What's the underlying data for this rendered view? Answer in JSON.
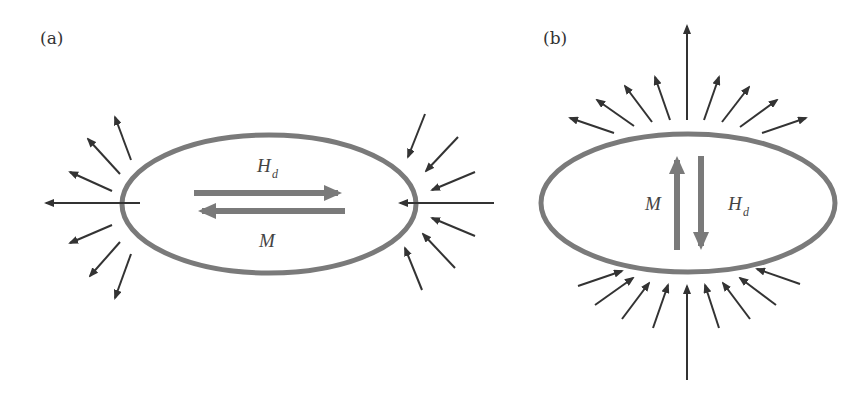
{
  "figure": {
    "panels": [
      {
        "id": "a",
        "label": "(a)",
        "orientation": "magnetization along long axis",
        "vectors": [
          {
            "symbol": "H",
            "subscript": "d",
            "direction": "right"
          },
          {
            "symbol": "M",
            "subscript": "",
            "direction": "left"
          }
        ],
        "field_lines": {
          "left_side": "outward",
          "right_side": "inward",
          "count_per_side": 7
        }
      },
      {
        "id": "b",
        "label": "(b)",
        "orientation": "magnetization along short axis",
        "vectors": [
          {
            "symbol": "M",
            "subscript": "",
            "direction": "up"
          },
          {
            "symbol": "H",
            "subscript": "d",
            "direction": "down"
          }
        ],
        "field_lines": {
          "top_side": "outward",
          "bottom_side": "inward",
          "count_per_side": 9
        }
      }
    ]
  },
  "colors": {
    "ellipse": "#7a7a7a",
    "vector_arrows": "#7a7a7a",
    "field_lines": "#333333",
    "background": "#ffffff"
  }
}
